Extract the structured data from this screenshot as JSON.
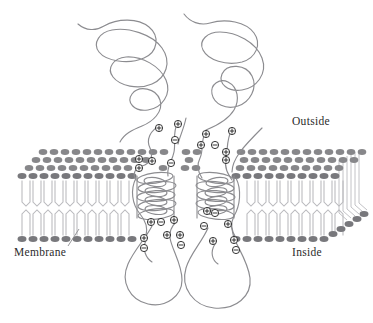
{
  "figure": {
    "width": 373,
    "height": 323,
    "background": "#ffffff"
  },
  "labels": {
    "outside": "Outside",
    "inside": "Inside",
    "membrane": "Membrane"
  },
  "colors": {
    "chain": "#8c8c90",
    "lipid_head": "#87878a",
    "lipid_head_dark": "#78787c",
    "lipid_tail": "#b9b9bd",
    "charge_outline": "#1f1f1f",
    "charge_fill": "#ffffff",
    "text": "#2b2b2b"
  },
  "diagram_data": {
    "type": "schematic",
    "subject": "membrane protein topology",
    "regions": [
      {
        "name": "extracellular",
        "label": "Outside",
        "position": "top"
      },
      {
        "name": "lipid-bilayer",
        "label": "Membrane",
        "position": "middle"
      },
      {
        "name": "intracellular",
        "label": "Inside",
        "position": "bottom"
      }
    ],
    "protein": {
      "helix_bundles": 2,
      "extracellular_loops": 2,
      "intracellular_loops": 2,
      "terminal_tails": 2
    },
    "bilayer": {
      "leaflets": 2,
      "head_rows_upper": 4,
      "head_rows_lower": 1,
      "perspective": "3d-cutaway-right"
    },
    "charges": {
      "positive_symbol": "+",
      "negative_symbol": "−",
      "positive_count": 22,
      "negative_count": 12
    }
  },
  "charge_markers": [
    {
      "x": 159,
      "y": 128,
      "sign": "+"
    },
    {
      "x": 178,
      "y": 124,
      "sign": "+"
    },
    {
      "x": 175,
      "y": 140,
      "sign": "-"
    },
    {
      "x": 206,
      "y": 134,
      "sign": "+"
    },
    {
      "x": 201,
      "y": 145,
      "sign": "+"
    },
    {
      "x": 215,
      "y": 145,
      "sign": "-"
    },
    {
      "x": 232,
      "y": 131,
      "sign": "+"
    },
    {
      "x": 226,
      "y": 152,
      "sign": "+"
    },
    {
      "x": 139,
      "y": 159,
      "sign": "+"
    },
    {
      "x": 139,
      "y": 168,
      "sign": "+"
    },
    {
      "x": 152,
      "y": 161,
      "sign": "+"
    },
    {
      "x": 171,
      "y": 163,
      "sign": "-"
    },
    {
      "x": 226,
      "y": 160,
      "sign": "+"
    },
    {
      "x": 207,
      "y": 211,
      "sign": "+"
    },
    {
      "x": 215,
      "y": 213,
      "sign": "-"
    },
    {
      "x": 151,
      "y": 222,
      "sign": "+"
    },
    {
      "x": 161,
      "y": 222,
      "sign": "-"
    },
    {
      "x": 174,
      "y": 220,
      "sign": "+"
    },
    {
      "x": 204,
      "y": 226,
      "sign": "-"
    },
    {
      "x": 228,
      "y": 224,
      "sign": "+"
    },
    {
      "x": 144,
      "y": 238,
      "sign": "+"
    },
    {
      "x": 144,
      "y": 248,
      "sign": "-"
    },
    {
      "x": 167,
      "y": 235,
      "sign": "+"
    },
    {
      "x": 180,
      "y": 235,
      "sign": "+"
    },
    {
      "x": 181,
      "y": 245,
      "sign": "-"
    },
    {
      "x": 213,
      "y": 241,
      "sign": "+"
    },
    {
      "x": 234,
      "y": 240,
      "sign": "+"
    },
    {
      "x": 236,
      "y": 250,
      "sign": "-"
    }
  ]
}
